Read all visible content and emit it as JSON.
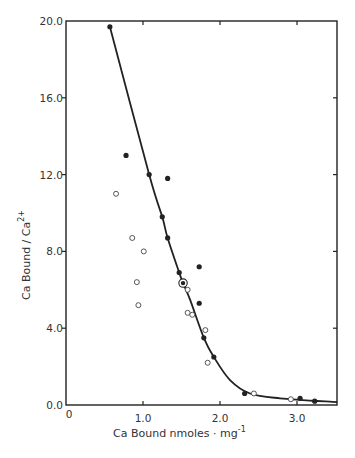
{
  "chart_data": {
    "type": "scatter",
    "title": "",
    "xlabel": "Ca Bound  nmoles · mg",
    "xlabel_superscript": "-1",
    "ylabel": "Ca  Bound / Ca",
    "ylabel_superscript": "2+",
    "xlim": [
      0,
      3.5
    ],
    "ylim": [
      0,
      20
    ],
    "x_ticks": [
      {
        "value": 0,
        "label": "0"
      },
      {
        "value": 1.0,
        "label": "1.0"
      },
      {
        "value": 2.0,
        "label": "2.0"
      },
      {
        "value": 3.0,
        "label": "3.0"
      }
    ],
    "y_ticks": [
      {
        "value": 0,
        "label": "0.0"
      },
      {
        "value": 4,
        "label": "4.0"
      },
      {
        "value": 8,
        "label": "8.0"
      },
      {
        "value": 12,
        "label": "12.0"
      },
      {
        "value": 16,
        "label": "16.0"
      },
      {
        "value": 20,
        "label": "20.0"
      }
    ],
    "grid": false,
    "legend": null,
    "series": [
      {
        "name": "filled circles",
        "marker": "filled",
        "points": [
          [
            0.57,
            19.7
          ],
          [
            0.78,
            13.0
          ],
          [
            1.08,
            12.0
          ],
          [
            1.32,
            11.8
          ],
          [
            1.25,
            9.8
          ],
          [
            1.32,
            8.7
          ],
          [
            1.47,
            6.9
          ],
          [
            1.73,
            7.2
          ],
          [
            1.73,
            5.3
          ],
          [
            1.79,
            3.5
          ],
          [
            1.92,
            2.5
          ],
          [
            2.32,
            0.6
          ],
          [
            3.04,
            0.35
          ],
          [
            3.23,
            0.2
          ]
        ]
      },
      {
        "name": "open circles",
        "marker": "open",
        "points": [
          [
            0.65,
            11.0
          ],
          [
            0.86,
            8.7
          ],
          [
            1.01,
            8.0
          ],
          [
            0.92,
            6.4
          ],
          [
            0.94,
            5.2
          ],
          [
            1.58,
            6.0
          ],
          [
            1.58,
            4.8
          ],
          [
            1.64,
            4.7
          ],
          [
            1.81,
            3.9
          ],
          [
            1.84,
            2.2
          ],
          [
            2.44,
            0.6
          ],
          [
            2.92,
            0.3
          ]
        ]
      },
      {
        "name": "circled dot",
        "marker": "circled-dot",
        "points": [
          [
            1.52,
            6.35
          ]
        ]
      },
      {
        "name": "fitted curve",
        "type": "line",
        "points": [
          [
            0.57,
            19.7
          ],
          [
            1.08,
            12.0
          ],
          [
            1.25,
            9.8
          ],
          [
            1.32,
            8.7
          ],
          [
            1.47,
            6.9
          ],
          [
            1.52,
            6.35
          ],
          [
            1.61,
            5.5
          ],
          [
            1.79,
            3.5
          ],
          [
            1.92,
            2.5
          ],
          [
            2.13,
            1.3
          ],
          [
            2.39,
            0.6
          ],
          [
            2.78,
            0.35
          ],
          [
            3.52,
            0.15
          ]
        ]
      }
    ]
  }
}
